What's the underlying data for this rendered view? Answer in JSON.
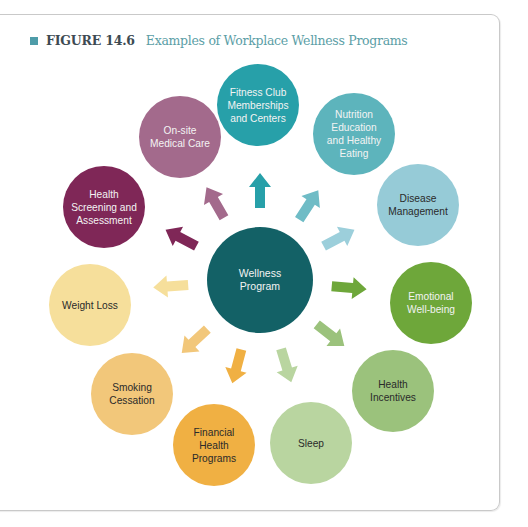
{
  "figure": {
    "label": "FIGURE 14.6",
    "title": "Examples of Workplace Wellness Programs",
    "accent_color": "#4e9ca9"
  },
  "center": {
    "label": "Wellness\nProgram",
    "color": "#136166"
  },
  "programs": [
    {
      "label": "Fitness Club\nMemberships\nand Centers",
      "color": "#27a0a9",
      "text": "light"
    },
    {
      "label": "Nutrition\nEducation\nand Healthy\nEating",
      "color": "#5db4bc",
      "text": "light"
    },
    {
      "label": "Disease\nManagement",
      "color": "#96cbd7",
      "text": "dark"
    },
    {
      "label": "Emotional\nWell-being",
      "color": "#6ea73a",
      "text": "light"
    },
    {
      "label": "Health\nIncentives",
      "color": "#9bc27c",
      "text": "dark"
    },
    {
      "label": "Sleep",
      "color": "#b9d5a0",
      "text": "dark"
    },
    {
      "label": "Financial\nHealth\nPrograms",
      "color": "#f0b043",
      "text": "dark"
    },
    {
      "label": "Smoking\nCessation",
      "color": "#f2c77a",
      "text": "dark"
    },
    {
      "label": "Weight Loss",
      "color": "#f6df9b",
      "text": "dark"
    },
    {
      "label": "Health\nScreening and\nAssessment",
      "color": "#7f2757",
      "text": "light"
    },
    {
      "label": "On-site\nMedical Care",
      "color": "#a36a8c",
      "text": "light"
    }
  ],
  "arrows": [
    {
      "target": "fitness",
      "color": "#27a0a9"
    },
    {
      "target": "nutrition",
      "color": "#6fbcc6"
    },
    {
      "target": "disease",
      "color": "#9ccfdb"
    },
    {
      "target": "emotional",
      "color": "#6ea73a"
    },
    {
      "target": "incentives",
      "color": "#9bc27c"
    },
    {
      "target": "sleep",
      "color": "#b9d5a0"
    },
    {
      "target": "financial",
      "color": "#f0b043"
    },
    {
      "target": "smoking",
      "color": "#f2c77a"
    },
    {
      "target": "weight",
      "color": "#f6df9b"
    },
    {
      "target": "screening",
      "color": "#7f2757"
    },
    {
      "target": "onsite",
      "color": "#a36a8c"
    }
  ]
}
